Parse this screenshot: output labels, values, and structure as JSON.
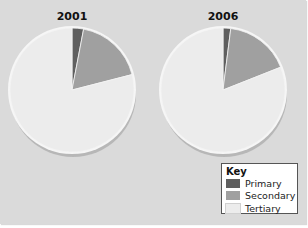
{
  "colors": {
    "primary": "#5f5f5f",
    "secondary": "#a0a0a0",
    "tertiary": "#ececec",
    "background": "#dadada"
  },
  "charts": [
    {
      "title": "2001"
    },
    {
      "title": "2006"
    }
  ],
  "key": {
    "title": "Key",
    "items": [
      {
        "label": "Primary"
      },
      {
        "label": "Secondary"
      },
      {
        "label": "Tertiary"
      }
    ]
  },
  "chart_data": [
    {
      "type": "pie",
      "title": "2001",
      "categories": [
        "Primary",
        "Secondary",
        "Tertiary"
      ],
      "values": [
        3,
        18,
        79
      ],
      "units": "% (estimated from slice angles)",
      "legend_position": "bottom-right",
      "start_angle": "12 o'clock, clockwise"
    },
    {
      "type": "pie",
      "title": "2006",
      "categories": [
        "Primary",
        "Secondary",
        "Tertiary"
      ],
      "values": [
        2,
        17,
        81
      ],
      "units": "% (estimated from slice angles)",
      "legend_position": "bottom-right",
      "start_angle": "12 o'clock, clockwise"
    }
  ]
}
